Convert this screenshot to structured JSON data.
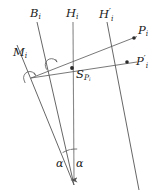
{
  "figure": {
    "type": "geometry-diagram",
    "width": 157,
    "height": 195,
    "background_color": "#ffffff",
    "stroke_color": "#555555",
    "text_color": "#1a1a1a",
    "labels": {
      "b_i": "B",
      "b_i_sub": "i",
      "h_i": "H",
      "h_i_sub": "i",
      "h_i_prime": "H",
      "h_i_prime_sup": "′",
      "h_i_prime_sub": "i",
      "m_i": "M",
      "m_i_sub": "i",
      "p_i": "P",
      "p_i_sub": "i",
      "p_i_prime": "P",
      "p_i_prime_sup": "′",
      "p_i_prime_sub": "i",
      "s_pi": "S",
      "s_pi_sub": "P",
      "s_pi_subsub": "i",
      "alpha_left": "α",
      "alpha_right": "α"
    },
    "points": {
      "apex": {
        "x": 74,
        "y": 185
      },
      "s_pi": {
        "x": 72,
        "y": 68
      },
      "p_i_dot": {
        "x": 134,
        "y": 38
      },
      "p_i_prime_dot": {
        "x": 127,
        "y": 62
      }
    },
    "lines": [
      {
        "name": "line-B-i",
        "x1": 37,
        "y1": 22,
        "x2": 74,
        "y2": 185
      },
      {
        "name": "line-H-i",
        "x1": 73,
        "y1": 22,
        "x2": 74,
        "y2": 185
      },
      {
        "name": "line-H-i-prime",
        "x1": 107,
        "y1": 22,
        "x2": 139,
        "y2": 190
      },
      {
        "name": "line-M-i",
        "x1": 17,
        "y1": 45,
        "x2": 74,
        "y2": 185
      },
      {
        "name": "ray-to-P-i",
        "x1": 31,
        "y1": 78,
        "x2": 138,
        "y2": 36
      },
      {
        "name": "ray-to-P-i-prime",
        "x1": 31,
        "y1": 78,
        "x2": 136,
        "y2": 62
      }
    ],
    "angle_marks": [
      {
        "name": "right-angle-on-B-i",
        "x": 50,
        "y": 63
      },
      {
        "name": "right-angle-on-M-i",
        "x": 29,
        "y": 77
      },
      {
        "name": "alpha-arc-left",
        "x": 68,
        "y": 155
      },
      {
        "name": "alpha-arc-right",
        "x": 74,
        "y": 155
      }
    ]
  }
}
